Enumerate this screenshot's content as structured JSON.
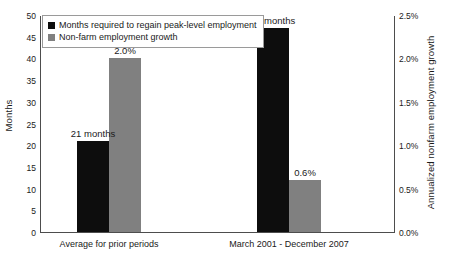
{
  "chart_data": {
    "type": "bar",
    "title": "",
    "subtitle": "",
    "categories": [
      "Average for prior periods",
      "March 2001 - December 2007"
    ],
    "series": [
      {
        "name": "Months required to regain peak-level employment",
        "axis": "left",
        "color": "#0d0d0d",
        "values": [
          21,
          47
        ],
        "data_labels": [
          "21 months",
          "47 months"
        ]
      },
      {
        "name": "Non-farm employment growth",
        "axis": "right",
        "color": "#808080",
        "values": [
          2.0,
          0.6
        ],
        "data_labels": [
          "2.0%",
          "0.6%"
        ]
      }
    ],
    "xlabel": "",
    "ylabel": "Months",
    "y2label": "Annualized nonfarm employment growth",
    "ylim": [
      0,
      50
    ],
    "y2lim": [
      0,
      2.5
    ],
    "yticks": [
      "50",
      "45",
      "40",
      "35",
      "30",
      "25",
      "20",
      "15",
      "10",
      "5",
      "0"
    ],
    "ytick_values": [
      50,
      45,
      40,
      35,
      30,
      25,
      20,
      15,
      10,
      5,
      0
    ],
    "y2ticks": [
      "2.5%",
      "2.0%",
      "1.5%",
      "1.0%",
      "0.5%",
      "0.0%"
    ],
    "y2tick_values": [
      2.5,
      2.0,
      1.5,
      1.0,
      0.5,
      0.0
    ],
    "grid": false,
    "legend_position": "top-left",
    "legend_entries": [
      "Months required to regain peak-level employment",
      "Non-farm employment growth"
    ]
  },
  "axes": {
    "left_title": "Months",
    "right_title": "Annualized nonfarm employment growth"
  },
  "colors": {
    "series_black": "#0d0d0d",
    "series_gray": "#808080",
    "axis_line": "#4d4d4d",
    "legend_border": "#9a9a9a",
    "background": "#ffffff",
    "text": "#1a1a1a"
  }
}
